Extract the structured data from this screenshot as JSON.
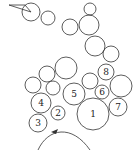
{
  "diagram": {
    "type": "circle-packing",
    "stroke_color": "#333333",
    "background": "#ffffff",
    "triangle": {
      "points": "9,5 25,5 31,12"
    },
    "circles": [
      {
        "id": "c-top-a",
        "cx": 31,
        "cy": 12,
        "r": 9,
        "label": ""
      },
      {
        "id": "c-top-b",
        "cx": 48,
        "cy": 18,
        "r": 7,
        "label": ""
      },
      {
        "id": "c-top-c",
        "cx": 70,
        "cy": 27,
        "r": 8,
        "label": ""
      },
      {
        "id": "c-top-d",
        "cx": 90,
        "cy": 9,
        "r": 6,
        "label": ""
      },
      {
        "id": "c-top-e",
        "cx": 89,
        "cy": 25,
        "r": 10,
        "label": ""
      },
      {
        "id": "c-mid-f",
        "cx": 95,
        "cy": 46,
        "r": 10,
        "label": ""
      },
      {
        "id": "c-mid-g",
        "cx": 111,
        "cy": 54,
        "r": 8,
        "label": ""
      },
      {
        "id": "c-8",
        "cx": 106,
        "cy": 72,
        "r": 8,
        "label": "8"
      },
      {
        "id": "c-upper-mid",
        "cx": 66,
        "cy": 68,
        "r": 11,
        "label": ""
      },
      {
        "id": "c-upper-left",
        "cx": 47,
        "cy": 74,
        "r": 8,
        "label": ""
      },
      {
        "id": "c-far-left",
        "cx": 33,
        "cy": 85,
        "r": 8,
        "label": ""
      },
      {
        "id": "c-small-mid",
        "cx": 53,
        "cy": 88,
        "r": 7,
        "label": ""
      },
      {
        "id": "c-5",
        "cx": 74,
        "cy": 94,
        "r": 11,
        "label": "5"
      },
      {
        "id": "c-near-8",
        "cx": 90,
        "cy": 81,
        "r": 8,
        "label": ""
      },
      {
        "id": "c-6",
        "cx": 102,
        "cy": 92,
        "r": 7,
        "label": "6"
      },
      {
        "id": "c-big-right",
        "cx": 121,
        "cy": 86,
        "r": 11,
        "label": ""
      },
      {
        "id": "c-4",
        "cx": 41,
        "cy": 103,
        "r": 10,
        "label": "4"
      },
      {
        "id": "c-2",
        "cx": 58,
        "cy": 113,
        "r": 7,
        "label": "2"
      },
      {
        "id": "c-1",
        "cx": 93,
        "cy": 114,
        "r": 16,
        "label": "1"
      },
      {
        "id": "c-7",
        "cx": 118,
        "cy": 107,
        "r": 9,
        "label": "7"
      },
      {
        "id": "c-3",
        "cx": 38,
        "cy": 123,
        "r": 9,
        "label": "3"
      }
    ],
    "arc": {
      "d": "M 38 150 C 48 128, 72 124, 90 150"
    },
    "arrow": {
      "points": "51,132 58,129 56,134"
    }
  }
}
